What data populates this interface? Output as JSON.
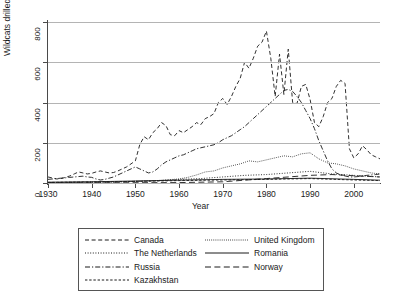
{
  "chart_data": {
    "type": "line",
    "title": "",
    "xlabel": "Year",
    "ylabel": "Wildcats drilled",
    "xlim": [
      1930,
      2006
    ],
    "ylim": [
      0,
      800
    ],
    "xticks": [
      1930,
      1940,
      1950,
      1960,
      1970,
      1980,
      1990,
      2000
    ],
    "yticks": [
      0,
      200,
      400,
      600,
      800
    ],
    "grid": "horizontal",
    "legend_position": "below-plot",
    "series": [
      {
        "name": "Canada",
        "dash": "dashed",
        "x": [
          1930,
          1931,
          1932,
          1933,
          1934,
          1935,
          1936,
          1937,
          1938,
          1939,
          1940,
          1941,
          1942,
          1943,
          1944,
          1945,
          1946,
          1947,
          1948,
          1949,
          1950,
          1951,
          1952,
          1953,
          1954,
          1955,
          1956,
          1957,
          1958,
          1959,
          1960,
          1961,
          1962,
          1963,
          1964,
          1965,
          1966,
          1967,
          1968,
          1969,
          1970,
          1971,
          1972,
          1973,
          1974,
          1975,
          1976,
          1977,
          1978,
          1979,
          1980,
          1981,
          1982,
          1983,
          1984,
          1985,
          1986,
          1987,
          1988,
          1989,
          1990,
          1991,
          1992,
          1993,
          1994,
          1995,
          1996,
          1997,
          1998,
          1999,
          2000,
          2001,
          2002,
          2003,
          2004,
          2005,
          2006
        ],
        "y": [
          30,
          25,
          20,
          22,
          28,
          35,
          45,
          55,
          50,
          45,
          48,
          55,
          60,
          55,
          50,
          52,
          60,
          70,
          80,
          95,
          110,
          190,
          230,
          215,
          250,
          270,
          300,
          285,
          240,
          235,
          260,
          250,
          265,
          280,
          300,
          290,
          320,
          330,
          345,
          400,
          420,
          390,
          430,
          480,
          520,
          600,
          570,
          620,
          680,
          700,
          755,
          620,
          430,
          640,
          440,
          665,
          400,
          395,
          480,
          490,
          415,
          300,
          280,
          330,
          400,
          420,
          480,
          510,
          495,
          170,
          125,
          145,
          185,
          165,
          140,
          130,
          120
        ]
      },
      {
        "name": "The Netherlands",
        "dash": "dotted",
        "x": [
          1930,
          1935,
          1940,
          1945,
          1950,
          1955,
          1960,
          1965,
          1970,
          1975,
          1980,
          1985,
          1990,
          1995,
          2000,
          2006
        ],
        "y": [
          2,
          3,
          4,
          5,
          8,
          12,
          18,
          22,
          30,
          38,
          42,
          50,
          58,
          45,
          38,
          30
        ]
      },
      {
        "name": "Russia",
        "dash": "dash-dot",
        "x": [
          1930,
          1931,
          1932,
          1933,
          1934,
          1935,
          1936,
          1937,
          1938,
          1939,
          1940,
          1941,
          1942,
          1943,
          1944,
          1945,
          1946,
          1947,
          1948,
          1949,
          1950,
          1951,
          1952,
          1953,
          1954,
          1955,
          1956,
          1957,
          1958,
          1959,
          1960,
          1961,
          1962,
          1963,
          1964,
          1965,
          1966,
          1967,
          1968,
          1969,
          1970,
          1971,
          1972,
          1973,
          1974,
          1975,
          1976,
          1977,
          1978,
          1979,
          1980,
          1981,
          1982,
          1983,
          1984,
          1985,
          1986,
          1987,
          1988,
          1989,
          1990,
          1991,
          1992,
          1993,
          1994,
          1995,
          1996,
          1997,
          1998,
          1999,
          2000,
          2001,
          2002,
          2003,
          2004,
          2005,
          2006
        ],
        "y": [
          18,
          20,
          22,
          24,
          26,
          28,
          30,
          32,
          34,
          30,
          28,
          20,
          15,
          18,
          24,
          30,
          40,
          50,
          60,
          70,
          80,
          70,
          60,
          50,
          55,
          70,
          90,
          105,
          115,
          125,
          135,
          140,
          150,
          160,
          170,
          175,
          180,
          185,
          190,
          200,
          215,
          225,
          235,
          250,
          265,
          280,
          300,
          320,
          340,
          360,
          380,
          400,
          420,
          440,
          460,
          465,
          455,
          430,
          400,
          360,
          320,
          270,
          210,
          160,
          110,
          70,
          50,
          40,
          35,
          30,
          30,
          32,
          35,
          38,
          40,
          42,
          45
        ]
      },
      {
        "name": "Kazakhstan",
        "dash": "short-dashed",
        "x": [
          1930,
          1940,
          1950,
          1960,
          1970,
          1980,
          1990,
          2000,
          2006
        ],
        "y": [
          3,
          5,
          8,
          12,
          15,
          18,
          22,
          15,
          12
        ]
      },
      {
        "name": "United Kingdom",
        "dash": "fine-dotted",
        "x": [
          1930,
          1935,
          1940,
          1945,
          1950,
          1955,
          1960,
          1962,
          1964,
          1966,
          1968,
          1970,
          1972,
          1974,
          1976,
          1978,
          1980,
          1982,
          1984,
          1986,
          1988,
          1990,
          1992,
          1994,
          1996,
          1998,
          2000,
          2002,
          2004,
          2006
        ],
        "y": [
          2,
          3,
          4,
          5,
          8,
          12,
          20,
          28,
          40,
          55,
          60,
          75,
          85,
          95,
          110,
          105,
          115,
          125,
          135,
          130,
          145,
          150,
          120,
          100,
          95,
          85,
          70,
          60,
          50,
          45
        ]
      },
      {
        "name": "Romania",
        "dash": "solid",
        "x": [
          1930,
          1940,
          1950,
          1960,
          1970,
          1980,
          1990,
          2000,
          2006
        ],
        "y": [
          4,
          6,
          10,
          14,
          18,
          20,
          24,
          18,
          14
        ]
      },
      {
        "name": "Norway",
        "dash": "long-dashed",
        "x": [
          1930,
          1945,
          1960,
          1970,
          1975,
          1980,
          1985,
          1990,
          1995,
          2000,
          2006
        ],
        "y": [
          1,
          1,
          2,
          6,
          14,
          22,
          30,
          38,
          42,
          36,
          30
        ]
      }
    ]
  },
  "legend": {
    "entries": [
      {
        "label": "Canada",
        "key": "dashed"
      },
      {
        "label": "The Netherlands",
        "key": "dotted"
      },
      {
        "label": "Russia",
        "key": "dash-dot"
      },
      {
        "label": "Kazakhstan",
        "key": "short-dashed"
      },
      {
        "label": "United Kingdom",
        "key": "fine-dotted"
      },
      {
        "label": "Romania",
        "key": "solid"
      },
      {
        "label": "Norway",
        "key": "long-dashed"
      }
    ]
  },
  "colors": {
    "line": "#1a1a1a",
    "grid": "#b4b4b4",
    "axis": "#4a4a4a",
    "background": "#ffffff"
  }
}
